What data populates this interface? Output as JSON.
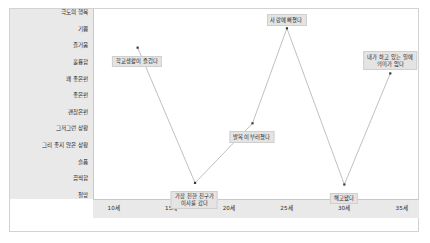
{
  "chart_data": {
    "type": "line",
    "title": "",
    "subtitle": "",
    "xlabel": "",
    "ylabel": "",
    "grid": false,
    "legend": "none",
    "x": [
      12,
      17,
      22,
      25,
      30,
      34
    ],
    "categories": [
      "10세",
      "15세",
      "20세",
      "25세",
      "30세",
      "35세"
    ],
    "x_ticks": [
      "10세",
      "15세",
      "20세",
      "25세",
      "30세",
      "35세"
    ],
    "x_tick_values": [
      10,
      15,
      20,
      25,
      30,
      35
    ],
    "xlim": [
      8.2,
      36.5
    ],
    "y_ticks": [
      "극도의 행복",
      "기쁨",
      "즐거움",
      "훌륭함",
      "꽤 좋은편",
      "좋은편",
      "괜찮은편",
      "그저그런 상황",
      "그리 좋지 않은 상황",
      "슬픔",
      "끔찍함",
      "절망"
    ],
    "y_tick_values": [
      12,
      11,
      10,
      9,
      8,
      7,
      6,
      5,
      4,
      3,
      2,
      1
    ],
    "ylim": [
      0.6,
      12.4
    ],
    "series": [
      {
        "name": "인생 만족도",
        "values": [
          10,
          1.6,
          5.3,
          11.2,
          1.5,
          8.4
        ]
      }
    ],
    "annotations": [
      {
        "text": "학교생활이 즐겁다",
        "x": 12,
        "y": 10,
        "lines": [
          "학교생활이 즐겁다"
        ]
      },
      {
        "text": "가장 친한 친구가 이사를 갔다",
        "x": 17,
        "y": 1.6,
        "lines": [
          "가장 친한 친구가",
          "이사를 갔다"
        ]
      },
      {
        "text": "발목이 부러졌다",
        "x": 22,
        "y": 5.3,
        "lines": [
          "발목이 부러졌다"
        ]
      },
      {
        "text": "사랑에 빠졌다",
        "x": 25,
        "y": 11.2,
        "lines": [
          "사랑에 빠졌다"
        ]
      },
      {
        "text": "해고됐다",
        "x": 30,
        "y": 1.5,
        "lines": [
          "해고됐다"
        ]
      },
      {
        "text": "내가 하고 있는 일에 의미가 없다",
        "x": 34,
        "y": 8.4,
        "lines": [
          "내가 하고 있는 일에",
          "의미가 없다"
        ]
      }
    ],
    "colors": {
      "line": "#b9b9b9",
      "marker": "#3a3a3a",
      "axis_band": "#e9e9e9",
      "frame": "#d2d2d2",
      "callout_bg": "#e4e4e4",
      "callout_border": "#cfcfcf",
      "text": "#1f1f1f",
      "background": "#ffffff"
    }
  }
}
